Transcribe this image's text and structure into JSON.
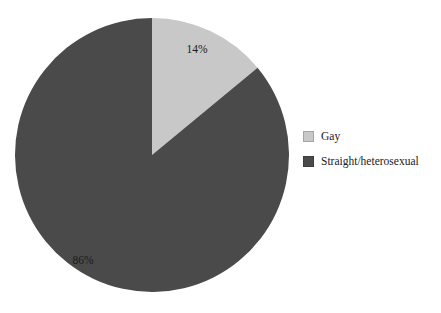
{
  "chart_data": {
    "type": "pie",
    "title": "",
    "labels": [
      "Gay",
      "Straight/heterosexual"
    ],
    "values": [
      14,
      86
    ],
    "value_labels": [
      "14%",
      "86%"
    ],
    "colors": [
      "#c8c8c8",
      "#4a4a4a"
    ],
    "units": "percent",
    "start_angle_deg": 0,
    "direction": "clockwise",
    "legend": {
      "position": "right",
      "entries": [
        {
          "label": "Gay",
          "color": "#c8c8c8",
          "value": 14,
          "value_label": "14%"
        },
        {
          "label": "Straight/heterosexual",
          "color": "#4a4a4a",
          "value": 86,
          "value_label": "86%"
        }
      ]
    },
    "slices": [
      {
        "name": "Gay",
        "value": 14,
        "value_label": "14%",
        "color": "#c8c8c8",
        "start_deg": 0,
        "sweep_deg": 50.4,
        "label_x": 197,
        "label_y": 50
      },
      {
        "name": "Straight/heterosexual",
        "value": 86,
        "value_label": "86%",
        "color": "#4a4a4a",
        "start_deg": 50.4,
        "sweep_deg": 309.6,
        "label_x": 83,
        "label_y": 261
      }
    ],
    "geometry": {
      "cx": 152,
      "cy": 155,
      "r": 137
    },
    "background": "#ffffff"
  }
}
